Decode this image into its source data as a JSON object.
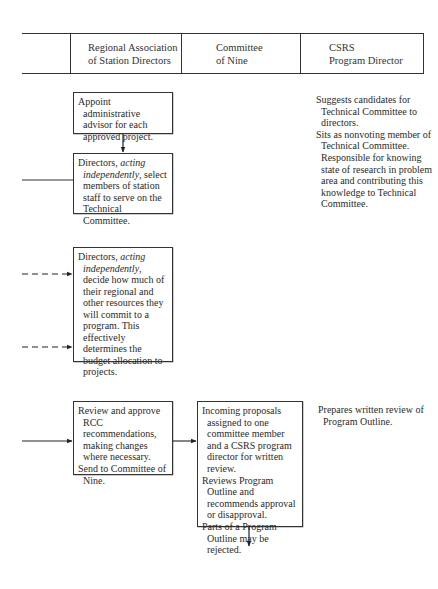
{
  "header": {
    "columns": [
      {
        "line1": "",
        "line2": ""
      },
      {
        "line1": "Regional Association",
        "line2": "of Station Directors"
      },
      {
        "line1": "Committee",
        "line2": "of Nine"
      },
      {
        "line1": "CSRS",
        "line2": "Program Director"
      }
    ]
  },
  "boxes": {
    "appoint_advisor": {
      "paragraphs": [
        "Appoint administrative advisor for each approved project."
      ]
    },
    "select_members": {
      "prefix": "Directors, ",
      "italic": "acting independently",
      "suffix": ", select members of station staff to serve on the Technical Committee."
    },
    "decide_resources": {
      "prefix": "Directors, ",
      "italic": "acting independently",
      "suffix": ", decide how much of their regional and other resources they will commit to a program. This effectively determines the budget allocation to projects."
    },
    "review_rcc": {
      "paragraphs": [
        "Review and approve RCC recommendations, making changes where necessary.",
        "Send to Committee of Nine."
      ]
    },
    "incoming_proposals": {
      "paragraphs": [
        "Incoming proposals assigned to one committee member and a CSRS program director for written review.",
        "Reviews Program Outline and recommends approval or disapproval.",
        "Parts of a Program Outline may be rejected."
      ]
    }
  },
  "notes": {
    "csrs_top": [
      "Suggests candidates for Technical Committee to directors.",
      "Sits as nonvoting member of Technical Committee. Responsible for knowing state of research in problem area and contributing this knowledge to Technical Committee."
    ],
    "csrs_bottom": [
      "Prepares written review of Program Outline."
    ]
  },
  "connectors": [
    {
      "from": "appoint_advisor",
      "to": "select_members",
      "style": "solid",
      "direction": "down"
    },
    {
      "from": "left-edge",
      "to": "select_members",
      "style": "solid",
      "direction": "right",
      "arrowhead": false
    },
    {
      "from": "left-edge",
      "to": "decide_resources",
      "style": "dashed",
      "direction": "right",
      "count": 2
    },
    {
      "from": "left-edge",
      "to": "review_rcc",
      "style": "solid",
      "direction": "right"
    },
    {
      "from": "review_rcc",
      "to": "incoming_proposals",
      "style": "solid",
      "direction": "right"
    },
    {
      "from": "incoming_proposals",
      "to": "below",
      "style": "solid",
      "direction": "down"
    }
  ]
}
